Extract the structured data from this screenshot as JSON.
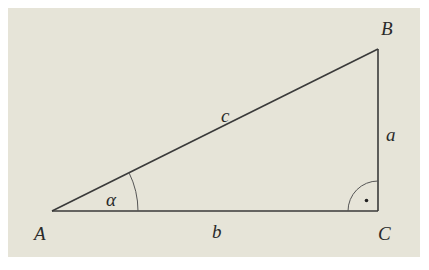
{
  "diagram": {
    "type": "right-triangle",
    "background_color": "#e6e4d8",
    "line_color": "#3a3a3a",
    "vertices": {
      "A": {
        "label": "A",
        "x": 52,
        "y": 211
      },
      "B": {
        "label": "B",
        "x": 378,
        "y": 49
      },
      "C": {
        "label": "C",
        "x": 378,
        "y": 211
      }
    },
    "sides": {
      "a": {
        "label": "a",
        "between": "B-C"
      },
      "b": {
        "label": "b",
        "between": "A-C"
      },
      "c": {
        "label": "c",
        "between": "A-B"
      }
    },
    "angles": {
      "alpha": {
        "label": "α",
        "at": "A"
      },
      "right_angle": {
        "label": "·",
        "at": "C"
      }
    }
  }
}
